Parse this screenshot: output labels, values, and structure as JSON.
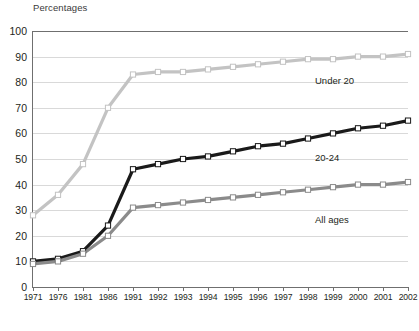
{
  "chart_data": {
    "type": "line",
    "title": "Percentages",
    "xlabel": "",
    "ylabel": "",
    "ylim": [
      0,
      100
    ],
    "ytick_step": 10,
    "grid": true,
    "legend_position": "inline-right",
    "categories": [
      "1971",
      "1976",
      "1981",
      "1986",
      "1991",
      "1992",
      "1993",
      "1994",
      "1995",
      "1996",
      "1997",
      "1998",
      "1999",
      "2000",
      "2001",
      "2002"
    ],
    "yticks": [
      "0",
      "10",
      "20",
      "30",
      "40",
      "50",
      "60",
      "70",
      "80",
      "90",
      "100"
    ],
    "series": [
      {
        "name": "Under 20",
        "color": "#c3c3c3",
        "marker": "square-open",
        "values": [
          28,
          36,
          48,
          70,
          83,
          84,
          84,
          85,
          86,
          87,
          88,
          89,
          89,
          90,
          90,
          91
        ]
      },
      {
        "name": "20-24",
        "color": "#1a1a1a",
        "marker": "square-open",
        "values": [
          10,
          11,
          14,
          24,
          46,
          48,
          50,
          51,
          53,
          55,
          56,
          58,
          60,
          62,
          63,
          65
        ]
      },
      {
        "name": "All ages",
        "color": "#8b8b8b",
        "marker": "square-open",
        "values": [
          9,
          10,
          13,
          20,
          31,
          32,
          33,
          34,
          35,
          36,
          37,
          38,
          39,
          40,
          40,
          41
        ]
      }
    ],
    "annotations": [
      {
        "text": "Under 20",
        "x": "1999",
        "y": 85
      },
      {
        "text": "20-24",
        "x": "1999",
        "y": 55
      },
      {
        "text": "All ages",
        "x": "1999",
        "y": 31
      }
    ]
  }
}
